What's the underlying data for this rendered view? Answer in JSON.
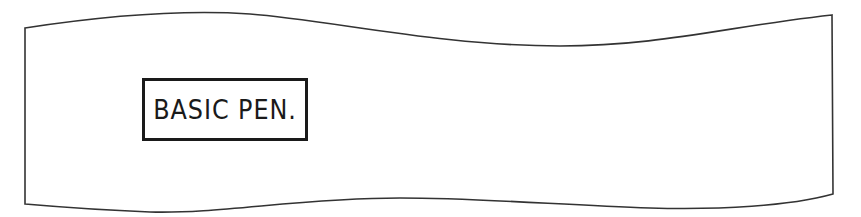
{
  "panel": {
    "label": "BASIC PEN.",
    "stroke_color": "#333333",
    "background": "#ffffff"
  }
}
